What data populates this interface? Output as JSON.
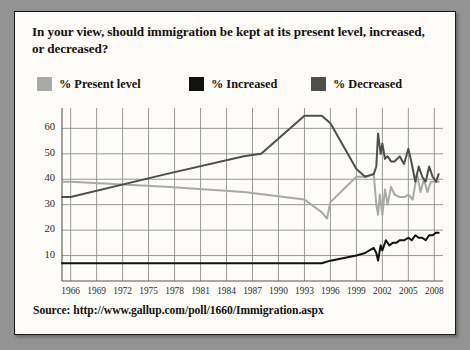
{
  "title": "In your view, should immigration be kept at its present level, increased, or decreased?",
  "source": "Source: http://www.gallup.com/poll/1660/Immigration.aspx",
  "legend": [
    {
      "label": "% Present level",
      "color": "#a9a9a9",
      "name": "present-level"
    },
    {
      "label": "% Increased",
      "color": "#121212",
      "name": "increased"
    },
    {
      "label": "% Decreased",
      "color": "#4f4f4f",
      "name": "decreased"
    }
  ],
  "colors": {
    "panel_background": "#fdfcf8",
    "outer_background": "#939393",
    "frame": "#1a1a1a",
    "grid": "#8d8d8d",
    "axis": "#555555",
    "text": "#15110e",
    "present_level": "#a9a9a9",
    "increased": "#121212",
    "decreased": "#4f4f4f"
  },
  "chart_data": {
    "type": "line",
    "title": "In your view, should immigration be kept at its present level, increased, or decreased?",
    "xlabel": "",
    "ylabel": "",
    "xlim": [
      1965,
      2009
    ],
    "ylim": [
      0,
      68
    ],
    "yticks": [
      10,
      20,
      30,
      40,
      50,
      60
    ],
    "xticks": [
      1966,
      1969,
      1972,
      1975,
      1978,
      1981,
      1984,
      1987,
      1990,
      1993,
      1996,
      1999,
      2002,
      2005,
      2008
    ],
    "grid": true,
    "legend_position": "top",
    "series": [
      {
        "name": "% Present level",
        "color": "#a9a9a9",
        "points": [
          [
            1965,
            39
          ],
          [
            1966,
            39
          ],
          [
            1977,
            37
          ],
          [
            1986,
            35
          ],
          [
            1993,
            32
          ],
          [
            1995,
            27
          ],
          [
            1995.6,
            24.5
          ],
          [
            1996,
            31
          ],
          [
            1999,
            41
          ],
          [
            2000,
            41
          ],
          [
            2001.0,
            42
          ],
          [
            2001.3,
            30
          ],
          [
            2001.5,
            26
          ],
          [
            2001.7,
            34
          ],
          [
            2002.0,
            26
          ],
          [
            2002.3,
            36
          ],
          [
            2002.6,
            30
          ],
          [
            2003.0,
            37
          ],
          [
            2003.4,
            34
          ],
          [
            2004.0,
            33
          ],
          [
            2004.6,
            33
          ],
          [
            2005.0,
            34
          ],
          [
            2005.5,
            32
          ],
          [
            2006.0,
            42
          ],
          [
            2006.4,
            35
          ],
          [
            2006.8,
            40
          ],
          [
            2007.2,
            35
          ],
          [
            2007.6,
            39
          ],
          [
            2008.0,
            39
          ],
          [
            2008.5,
            39
          ]
        ]
      },
      {
        "name": "% Increased",
        "color": "#121212",
        "points": [
          [
            1965,
            7
          ],
          [
            1966,
            7
          ],
          [
            1977,
            7
          ],
          [
            1986,
            7
          ],
          [
            1993,
            7
          ],
          [
            1995,
            7
          ],
          [
            1996,
            8
          ],
          [
            1999,
            10
          ],
          [
            2000,
            11
          ],
          [
            2001.0,
            13
          ],
          [
            2001.3,
            11
          ],
          [
            2001.5,
            8
          ],
          [
            2001.8,
            14
          ],
          [
            2002.0,
            12
          ],
          [
            2002.4,
            16
          ],
          [
            2002.8,
            14
          ],
          [
            2003.2,
            15
          ],
          [
            2003.6,
            15
          ],
          [
            2004.0,
            16
          ],
          [
            2004.5,
            16
          ],
          [
            2005.0,
            17
          ],
          [
            2005.4,
            16
          ],
          [
            2005.8,
            18
          ],
          [
            2006.2,
            17
          ],
          [
            2006.6,
            17
          ],
          [
            2007.0,
            16
          ],
          [
            2007.4,
            18
          ],
          [
            2007.8,
            18
          ],
          [
            2008.2,
            19
          ],
          [
            2008.5,
            19
          ]
        ]
      },
      {
        "name": "% Decreased",
        "color": "#4f4f4f",
        "points": [
          [
            1965,
            33
          ],
          [
            1966,
            33
          ],
          [
            1977,
            42
          ],
          [
            1986,
            49
          ],
          [
            1988,
            50
          ],
          [
            1993,
            65
          ],
          [
            1995,
            65
          ],
          [
            1996,
            62
          ],
          [
            1999,
            44
          ],
          [
            2000,
            41
          ],
          [
            2001.0,
            42
          ],
          [
            2001.3,
            45
          ],
          [
            2001.5,
            58
          ],
          [
            2001.8,
            50
          ],
          [
            2002.0,
            54
          ],
          [
            2002.3,
            48
          ],
          [
            2002.6,
            49
          ],
          [
            2003.0,
            47
          ],
          [
            2003.4,
            47
          ],
          [
            2004.0,
            49
          ],
          [
            2004.5,
            46
          ],
          [
            2005.0,
            52
          ],
          [
            2005.4,
            46
          ],
          [
            2005.8,
            39
          ],
          [
            2006.2,
            45
          ],
          [
            2006.6,
            41
          ],
          [
            2007.0,
            39
          ],
          [
            2007.4,
            45
          ],
          [
            2007.8,
            41
          ],
          [
            2008.2,
            39
          ],
          [
            2008.5,
            42
          ]
        ]
      }
    ]
  }
}
